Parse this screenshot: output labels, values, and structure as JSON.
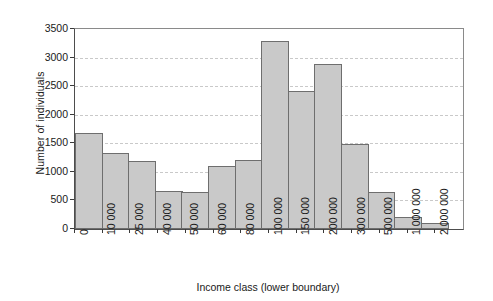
{
  "chart_data": {
    "type": "bar",
    "title": "",
    "xlabel": "Income class (lower boundary)",
    "ylabel": "Number of individuals",
    "categories": [
      "0",
      "10 000",
      "25 000",
      "40 000",
      "50 000",
      "60 000",
      "80 000",
      "100 000",
      "150 000",
      "200 000",
      "300 000",
      "500 000",
      "1 000 000",
      "2 000 000"
    ],
    "values": [
      1680,
      1330,
      1190,
      670,
      640,
      1110,
      1210,
      3290,
      2410,
      2890,
      1490,
      640,
      210,
      100
    ],
    "ylim": [
      0,
      3500
    ],
    "yticks": [
      0,
      500,
      1000,
      1500,
      2000,
      2500,
      3000,
      3500
    ],
    "ytick_labels": [
      "0",
      "500",
      "1000",
      "1500",
      "2000",
      "2500",
      "3000",
      "3500"
    ],
    "grid": true,
    "legend": false,
    "bar_fill": "#c9c9c9",
    "bar_edge": "#6e6e6e",
    "grid_color": "#c9c9c9"
  }
}
